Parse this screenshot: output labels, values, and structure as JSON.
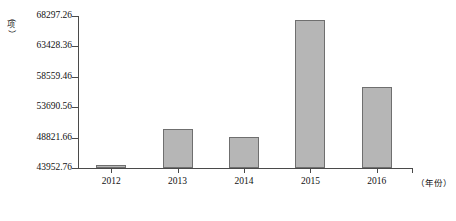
{
  "chart_data": {
    "type": "bar",
    "title": "",
    "subtitle": "",
    "xlabel": "（年份）",
    "ylabel": "（项）",
    "categories": [
      "2012",
      "2013",
      "2014",
      "2015",
      "2016"
    ],
    "values": [
      44440,
      50250,
      48950,
      67600,
      56900
    ],
    "ylim": [
      43952.76,
      68297.26
    ],
    "y_ticks": [
      "43952.76",
      "48821.66",
      "53690.56",
      "58559.46",
      "63428.36",
      "68297.26"
    ],
    "y_tick_values": [
      43952.76,
      48821.66,
      53690.56,
      58559.46,
      63428.36,
      68297.26
    ],
    "grid": false,
    "legend": null,
    "series": [
      {
        "name": "",
        "values": [
          44440,
          50250,
          48950,
          67600,
          56900
        ]
      }
    ],
    "bar_color": "#b6b6b6",
    "bar_border_color": "#6f6f6f",
    "axis_color": "#4a4a4a"
  },
  "axes": {
    "y_unit": {
      "open_paren": "（",
      "char": "项",
      "close_paren": "）"
    },
    "x_unit": "（年份）"
  }
}
